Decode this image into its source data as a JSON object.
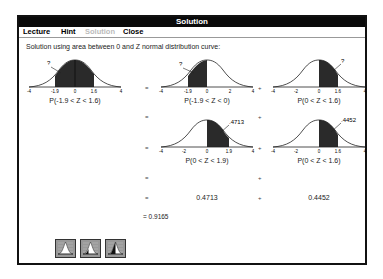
{
  "window": {
    "title": "Solution"
  },
  "menu": [
    {
      "label": "Lecture",
      "mnemonic": "L",
      "enabled": true
    },
    {
      "label": "Hint",
      "mnemonic": "H",
      "enabled": true
    },
    {
      "label": "Solution",
      "mnemonic": "S",
      "enabled": false
    },
    {
      "label": "Close",
      "mnemonic": "C",
      "enabled": true
    }
  ],
  "intro_text": "Solution using area between 0 and Z normal distribution curve:",
  "graphs": [
    {
      "id": "g1",
      "shade_from": -1.9,
      "shade_to": 1.6,
      "annotation": "?",
      "ticks": [
        "-4",
        "-1.9",
        "0",
        "1.6",
        "4"
      ],
      "caption": "P(-1.9 < Z < 1.6)"
    },
    {
      "id": "g2",
      "shade_from": -1.9,
      "shade_to": 0,
      "annotation": "?",
      "ticks": [
        "-4",
        "-1.9",
        "0",
        "2",
        "4"
      ],
      "caption": "P(-1.9 < Z < 0)"
    },
    {
      "id": "g3",
      "shade_from": 0,
      "shade_to": 1.6,
      "annotation": "?",
      "ticks": [
        "-4",
        "-2",
        "0",
        "1.6",
        "4"
      ],
      "caption": "P(0 < Z < 1.6)"
    },
    {
      "id": "g4",
      "shade_from": 0,
      "shade_to": 1.9,
      "annotation": ".4713",
      "ticks": [
        "-4",
        "-2",
        "0",
        "1.9",
        "4"
      ],
      "caption": "P(0 < Z < 1.9)"
    },
    {
      "id": "g5",
      "shade_from": 0,
      "shade_to": 1.6,
      "annotation": ".4452",
      "ticks": [
        "-4",
        "-2",
        "0",
        "1.6",
        "4"
      ],
      "caption": "P(0 < Z < 1.6)"
    }
  ],
  "values": {
    "left": "0.4713",
    "right": "0.4452"
  },
  "result": "= 0.9165",
  "operators": {
    "eq": "=",
    "plus": "+"
  },
  "toolbar": [
    {
      "name": "normal-curve-unshaded"
    },
    {
      "name": "normal-curve-partial"
    },
    {
      "name": "normal-curve-shaded"
    }
  ]
}
